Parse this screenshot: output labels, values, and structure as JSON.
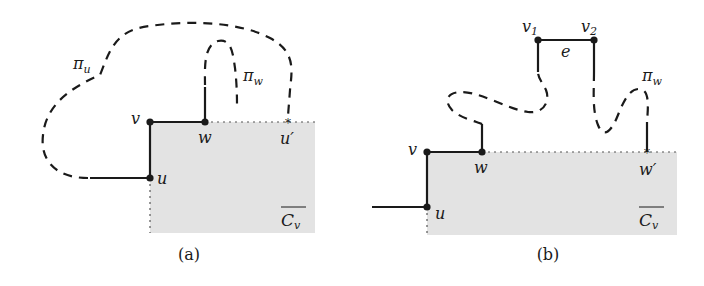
{
  "figure": {
    "panels": [
      {
        "id": "a",
        "caption": "(a)",
        "vertices": {
          "v": "v",
          "w": "w",
          "u": "u",
          "u_prime": "u′"
        },
        "paths": {
          "pi_u": "π",
          "pi_u_sub": "u",
          "pi_w": "π",
          "pi_w_sub": "w"
        },
        "region": {
          "label": "C",
          "label_sub": "v"
        }
      },
      {
        "id": "b",
        "caption": "(b)",
        "vertices": {
          "v": "v",
          "w": "w",
          "u": "u",
          "w_prime": "w′",
          "v1": "v",
          "v1_sub": "1",
          "v2": "v",
          "v2_sub": "2"
        },
        "edge_label": "e",
        "paths": {
          "pi_w": "π",
          "pi_w_sub": "w"
        },
        "region": {
          "label": "C",
          "label_sub": "v"
        }
      }
    ],
    "colors": {
      "ink": "#1a1a1a",
      "region_fill": "#e3e3e3"
    }
  }
}
